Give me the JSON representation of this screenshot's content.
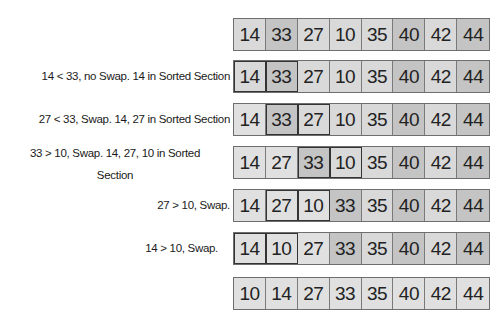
{
  "steps": [
    {
      "label": "",
      "values": [
        "14",
        "33",
        "27",
        "10",
        "35",
        "40",
        "42",
        "44"
      ],
      "highlight": [],
      "top": 18
    },
    {
      "label": "14 < 33, no Swap. 14 in Sorted Section",
      "values": [
        "14",
        "33",
        "27",
        "10",
        "35",
        "40",
        "42",
        "44"
      ],
      "highlight": [
        0,
        1
      ],
      "top": 60
    },
    {
      "label": "27 < 33, Swap. 14, 27 in Sorted Section",
      "values": [
        "14",
        "33",
        "27",
        "10",
        "35",
        "40",
        "42",
        "44"
      ],
      "highlight": [
        1,
        2
      ],
      "top": 103
    },
    {
      "label": "33 > 10, Swap. 14, 27, 10 in Sorted Section",
      "label_line1": "33 > 10, Swap. 14, 27, 10 in Sorted",
      "label_line2": "Section",
      "values": [
        "14",
        "27",
        "33",
        "10",
        "35",
        "40",
        "42",
        "44"
      ],
      "highlight": [
        2,
        3
      ],
      "top": 146
    },
    {
      "label": "27 > 10, Swap.",
      "values": [
        "14",
        "27",
        "10",
        "33",
        "35",
        "40",
        "42",
        "44"
      ],
      "highlight": [
        1,
        2
      ],
      "top": 189
    },
    {
      "label": "14 > 10, Swap.",
      "values": [
        "14",
        "10",
        "27",
        "33",
        "35",
        "40",
        "42",
        "44"
      ],
      "highlight": [
        0,
        1
      ],
      "top": 232
    },
    {
      "label": "",
      "values": [
        "10",
        "14",
        "27",
        "33",
        "35",
        "40",
        "42",
        "44"
      ],
      "highlight": [],
      "top": 277
    }
  ],
  "colors": {
    "cell": "#d9d9d9",
    "border": "#6e6e6e",
    "highlight_border": "#333333",
    "text": "#1a1a1a"
  }
}
